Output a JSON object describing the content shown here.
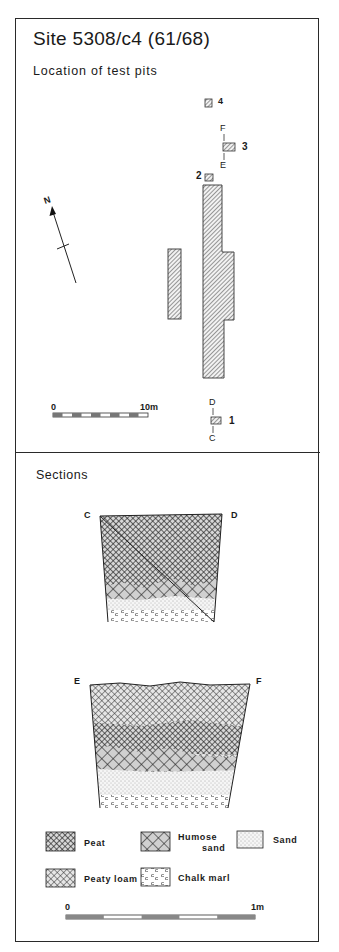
{
  "title": "Site 5308/c4 (61/68)",
  "plan": {
    "heading": "Location of test pits",
    "north_label": "N",
    "test_pits": [
      {
        "id": "4",
        "label": "4"
      },
      {
        "id": "3",
        "label": "3"
      },
      {
        "id": "2",
        "label": "2"
      },
      {
        "id": "1",
        "label": "1"
      }
    ],
    "section_lines": [
      {
        "start": "F",
        "end": "E",
        "pit": "3"
      },
      {
        "start": "D",
        "end": "C",
        "pit": "1"
      }
    ],
    "scale": {
      "start_label": "0",
      "end_label": "10m",
      "segments": 10
    }
  },
  "sections": {
    "heading": "Sections",
    "profiles": [
      {
        "left_label": "C",
        "right_label": "D",
        "layers": [
          "Peat",
          "Humose sand",
          "Sand",
          "Chalk marl"
        ]
      },
      {
        "left_label": "E",
        "right_label": "F",
        "layers": [
          "Peaty loam",
          "Peat",
          "Humose sand",
          "Sand",
          "Chalk marl"
        ]
      }
    ],
    "legend": [
      {
        "key": "peat",
        "label": "Peat"
      },
      {
        "key": "humose",
        "label_line1": "Humose",
        "label_line2": "sand"
      },
      {
        "key": "sand",
        "label": "Sand"
      },
      {
        "key": "peatyloam",
        "label": "Peaty loam"
      },
      {
        "key": "chalk",
        "label": "Chalk marl"
      }
    ],
    "scale": {
      "start_label": "0",
      "end_label": "1m",
      "segments": 5
    }
  }
}
